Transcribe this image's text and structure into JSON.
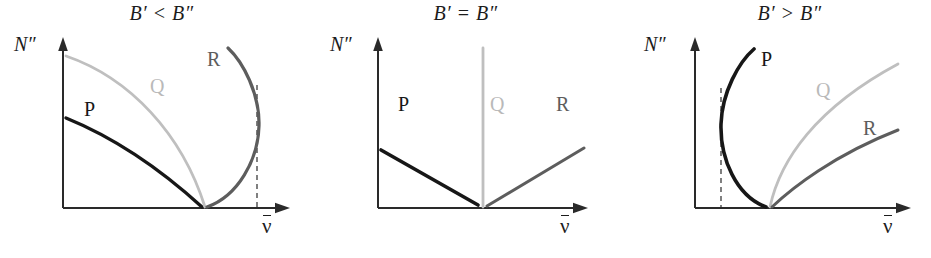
{
  "figure": {
    "type": "fortrat-diagram-set",
    "background_color": "#ffffff",
    "panel_count": 3
  },
  "colors": {
    "axis": "#2a2a2a",
    "branch_P": "#171717",
    "branch_Q": "#bfbfbf",
    "branch_R": "#5d5d5d",
    "dashed_line": "#4a4a4a",
    "title_text": "#1c1c1c"
  },
  "axes": {
    "y_label": "N″",
    "x_label_symbol": "ν",
    "x_label_has_overbar": true,
    "x_label_description": "nu-bar (wavenumber)"
  },
  "panels": [
    {
      "id": "panel-0",
      "title": "B′ < B″",
      "condition": "B' less than B''",
      "branches": [
        {
          "name": "P",
          "label": "P",
          "color": "#171717",
          "shape": "concave-down curve descending from upper-left to origin-vertex",
          "band_head": false
        },
        {
          "name": "Q",
          "label": "Q",
          "color": "#bfbfbf",
          "shape": "concave-down curve from y-axis top descending to vertex",
          "band_head": false
        },
        {
          "name": "R",
          "label": "R",
          "color": "#5d5d5d",
          "shape": "curve from vertex bending right then back left, forming band head",
          "band_head": true
        }
      ],
      "band_head_line": {
        "present": true,
        "style": "dashed",
        "orientation": "vertical",
        "side": "right"
      },
      "degradation": "shaded toward lower wavenumber (red-degraded)"
    },
    {
      "id": "panel-1",
      "title": "B′ = B″",
      "condition": "B' equal to B''",
      "branches": [
        {
          "name": "P",
          "label": "P",
          "color": "#171717",
          "shape": "straight line descending to vertex",
          "band_head": false
        },
        {
          "name": "Q",
          "label": "Q",
          "color": "#bfbfbf",
          "shape": "vertical straight line at vertex",
          "band_head": false
        },
        {
          "name": "R",
          "label": "R",
          "color": "#5d5d5d",
          "shape": "straight line ascending from vertex",
          "band_head": false
        }
      ],
      "band_head_line": {
        "present": false
      },
      "degradation": "no degradation; branches are straight lines"
    },
    {
      "id": "panel-2",
      "title": "B′ > B″",
      "condition": "B' greater than B''",
      "branches": [
        {
          "name": "P",
          "label": "P",
          "color": "#171717",
          "shape": "curve from vertex bending left then back right, forming band head",
          "band_head": true
        },
        {
          "name": "Q",
          "label": "Q",
          "color": "#bfbfbf",
          "shape": "concave-down curve ascending from vertex to upper right",
          "band_head": false
        },
        {
          "name": "R",
          "label": "R",
          "color": "#5d5d5d",
          "shape": "concave-down curve ascending from vertex to right, below Q",
          "band_head": false
        }
      ],
      "band_head_line": {
        "present": true,
        "style": "dashed",
        "orientation": "vertical",
        "side": "left"
      },
      "degradation": "shaded toward higher wavenumber (violet-degraded)"
    }
  ]
}
